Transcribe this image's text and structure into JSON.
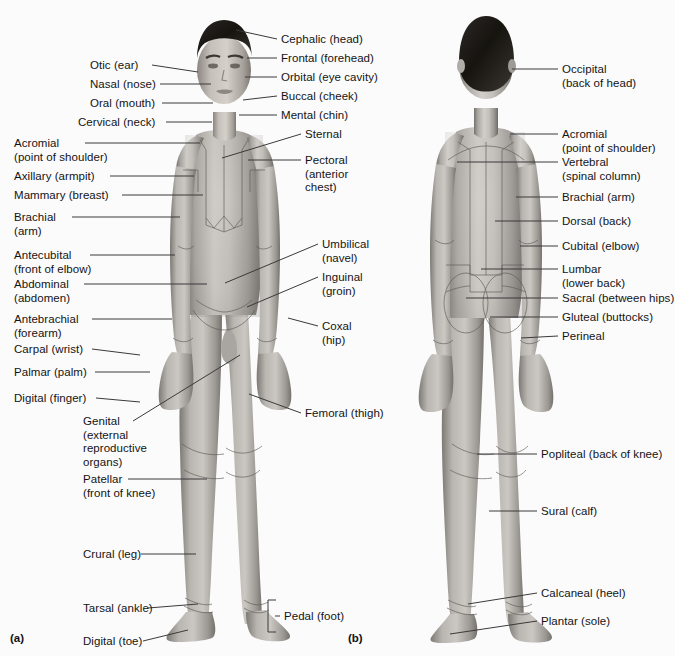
{
  "figure": {
    "background_color": "#fbfbfc",
    "text_color": "#141414",
    "leader_color": "#3a3a3a"
  },
  "captions": [
    {
      "id": "a",
      "text": "(a)",
      "x": 10,
      "y": 632
    },
    {
      "id": "b",
      "text": "(b)",
      "x": 348,
      "y": 632
    }
  ],
  "anterior": {
    "view": "anterior",
    "caption": "(a)",
    "labels_left": [
      {
        "name": "otic",
        "text": "Otic (ear)",
        "x": 90,
        "y": 59,
        "lx": 152,
        "ly": 65,
        "px": 198,
        "py": 72
      },
      {
        "name": "nasal",
        "text": "Nasal (nose)",
        "x": 90,
        "y": 78,
        "lx": 160,
        "ly": 84,
        "px": 211,
        "py": 84
      },
      {
        "name": "oral",
        "text": "Oral (mouth)",
        "x": 90,
        "y": 97,
        "lx": 162,
        "ly": 103,
        "px": 213,
        "py": 103
      },
      {
        "name": "cervical",
        "text": "Cervical (neck)",
        "x": 78,
        "y": 116,
        "lx": 166,
        "ly": 122,
        "px": 212,
        "py": 122
      },
      {
        "name": "acromial",
        "text": "Acromial\n(point of shoulder)",
        "x": 14,
        "y": 137,
        "lx": 85,
        "ly": 143,
        "px": 200,
        "py": 143
      },
      {
        "name": "axillary",
        "text": "Axillary (armpit)",
        "x": 14,
        "y": 170,
        "lx": 110,
        "ly": 176,
        "px": 194,
        "py": 176
      },
      {
        "name": "mammary",
        "text": "Mammary (breast)",
        "x": 14,
        "y": 189,
        "lx": 122,
        "ly": 195,
        "px": 203,
        "py": 195
      },
      {
        "name": "brachial",
        "text": "Brachial\n(arm)",
        "x": 14,
        "y": 211,
        "lx": 72,
        "ly": 217,
        "px": 180,
        "py": 217
      },
      {
        "name": "antecubital",
        "text": "Antecubital\n(front of elbow)",
        "x": 14,
        "y": 249,
        "lx": 90,
        "ly": 255,
        "px": 175,
        "py": 255
      },
      {
        "name": "abdominal",
        "text": "Abdominal\n(abdomen)",
        "x": 14,
        "y": 278,
        "lx": 84,
        "ly": 284,
        "px": 207,
        "py": 284
      },
      {
        "name": "antebrachial",
        "text": "Antebrachial\n(forearm)",
        "x": 14,
        "y": 313,
        "lx": 92,
        "ly": 319,
        "px": 172,
        "py": 319
      },
      {
        "name": "carpal",
        "text": "Carpal (wrist)",
        "x": 14,
        "y": 343,
        "lx": 92,
        "ly": 349,
        "px": 140,
        "py": 355
      },
      {
        "name": "palmar",
        "text": "Palmar (palm)",
        "x": 14,
        "y": 366,
        "lx": 95,
        "ly": 372,
        "px": 150,
        "py": 372
      },
      {
        "name": "digital-finger",
        "text": "Digital (finger)",
        "x": 14,
        "y": 392,
        "lx": 96,
        "ly": 398,
        "px": 140,
        "py": 402
      },
      {
        "name": "genital",
        "text": "Genital\n(external\nreproductive\norgans)",
        "x": 83,
        "y": 415,
        "lx": 133,
        "ly": 421,
        "px": 240,
        "py": 355
      },
      {
        "name": "patellar",
        "text": "Patellar\n(front of knee)",
        "x": 83,
        "y": 473,
        "lx": 128,
        "ly": 479,
        "px": 207,
        "py": 479
      },
      {
        "name": "crural",
        "text": "Crural (leg)",
        "x": 83,
        "y": 548,
        "lx": 141,
        "ly": 554,
        "px": 196,
        "py": 554
      },
      {
        "name": "tarsal",
        "text": "Tarsal (ankle)",
        "x": 83,
        "y": 602,
        "lx": 148,
        "ly": 608,
        "px": 198,
        "py": 604
      },
      {
        "name": "digital-toe",
        "text": "Digital (toe)",
        "x": 83,
        "y": 635,
        "lx": 143,
        "ly": 641,
        "px": 188,
        "py": 630
      }
    ],
    "labels_right": [
      {
        "name": "cephalic",
        "text": "Cephalic (head)",
        "x": 281,
        "y": 33,
        "lx": 277,
        "ly": 39,
        "px": 236,
        "py": 30
      },
      {
        "name": "frontal",
        "text": "Frontal (forehead)",
        "x": 281,
        "y": 52,
        "lx": 277,
        "ly": 58,
        "px": 247,
        "py": 58
      },
      {
        "name": "orbital",
        "text": "Orbital (eye cavity)",
        "x": 281,
        "y": 71,
        "lx": 277,
        "ly": 77,
        "px": 245,
        "py": 77
      },
      {
        "name": "buccal",
        "text": "Buccal (cheek)",
        "x": 281,
        "y": 90,
        "lx": 277,
        "ly": 96,
        "px": 243,
        "py": 100
      },
      {
        "name": "mental",
        "text": "Mental (chin)",
        "x": 281,
        "y": 109,
        "lx": 277,
        "ly": 115,
        "px": 239,
        "py": 115
      },
      {
        "name": "sternal",
        "text": "Sternal",
        "x": 305,
        "y": 128,
        "lx": 301,
        "ly": 134,
        "px": 222,
        "py": 158
      },
      {
        "name": "pectoral",
        "text": "Pectoral\n(anterior\nchest)",
        "x": 305,
        "y": 154,
        "lx": 301,
        "ly": 160,
        "px": 248,
        "py": 160
      },
      {
        "name": "umbilical",
        "text": "Umbilical\n(navel)",
        "x": 322,
        "y": 238,
        "lx": 318,
        "ly": 244,
        "px": 225,
        "py": 283
      },
      {
        "name": "inguinal",
        "text": "Inguinal\n(groin)",
        "x": 322,
        "y": 271,
        "lx": 318,
        "ly": 277,
        "px": 247,
        "py": 307
      },
      {
        "name": "coxal",
        "text": "Coxal\n(hip)",
        "x": 322,
        "y": 320,
        "lx": 318,
        "ly": 326,
        "px": 288,
        "py": 318
      },
      {
        "name": "femoral",
        "text": "Femoral (thigh)",
        "x": 305,
        "y": 407,
        "lx": 301,
        "ly": 413,
        "px": 249,
        "py": 394
      },
      {
        "name": "pedal",
        "text": "Pedal (foot)",
        "x": 284,
        "y": 610,
        "lx": 280,
        "ly": 616,
        "px": 275,
        "py": 616
      }
    ],
    "pedal_bracket": {
      "name": "pedal-bracket",
      "x": 268,
      "y": 600,
      "width": 8,
      "height": 32
    }
  },
  "posterior": {
    "view": "posterior",
    "caption": "(b)",
    "labels_right": [
      {
        "name": "occipital",
        "text": "Occipital\n(back of head)",
        "x": 562,
        "y": 63,
        "lx": 558,
        "ly": 69,
        "px": 512,
        "py": 69
      },
      {
        "name": "acromial-p",
        "text": "Acromial\n(point of shoulder)",
        "x": 562,
        "y": 128,
        "lx": 558,
        "ly": 134,
        "px": 510,
        "py": 134
      },
      {
        "name": "vertebral",
        "text": "Vertebral\n(spinal column)",
        "x": 562,
        "y": 156,
        "lx": 558,
        "ly": 162,
        "px": 457,
        "py": 162
      },
      {
        "name": "brachial-p",
        "text": "Brachial (arm)",
        "x": 562,
        "y": 191,
        "lx": 558,
        "ly": 197,
        "px": 516,
        "py": 197
      },
      {
        "name": "dorsal",
        "text": "Dorsal (back)",
        "x": 562,
        "y": 215,
        "lx": 558,
        "ly": 221,
        "px": 495,
        "py": 221
      },
      {
        "name": "cubital",
        "text": "Cubital (elbow)",
        "x": 562,
        "y": 240,
        "lx": 558,
        "ly": 246,
        "px": 520,
        "py": 246
      },
      {
        "name": "lumbar",
        "text": "Lumbar\n(lower back)",
        "x": 562,
        "y": 263,
        "lx": 558,
        "ly": 269,
        "px": 481,
        "py": 269
      },
      {
        "name": "sacral",
        "text": "Sacral (between hips)",
        "x": 562,
        "y": 292,
        "lx": 558,
        "ly": 298,
        "px": 466,
        "py": 298
      },
      {
        "name": "gluteal",
        "text": "Gluteal (buttocks)",
        "x": 562,
        "y": 311,
        "lx": 558,
        "ly": 317,
        "px": 490,
        "py": 317
      },
      {
        "name": "perineal",
        "text": "Perineal",
        "x": 562,
        "y": 330,
        "lx": 558,
        "ly": 336,
        "px": 521,
        "py": 338
      },
      {
        "name": "popliteal",
        "text": "Popliteal (back of knee)",
        "x": 541,
        "y": 448,
        "lx": 537,
        "ly": 454,
        "px": 477,
        "py": 454
      },
      {
        "name": "sural",
        "text": "Sural (calf)",
        "x": 541,
        "y": 505,
        "lx": 537,
        "ly": 511,
        "px": 489,
        "py": 511
      },
      {
        "name": "calcaneal",
        "text": "Calcaneal (heel)",
        "x": 541,
        "y": 587,
        "lx": 537,
        "ly": 593,
        "px": 468,
        "py": 604
      },
      {
        "name": "plantar",
        "text": "Plantar (sole)",
        "x": 541,
        "y": 615,
        "lx": 537,
        "ly": 621,
        "px": 450,
        "py": 634
      }
    ]
  }
}
